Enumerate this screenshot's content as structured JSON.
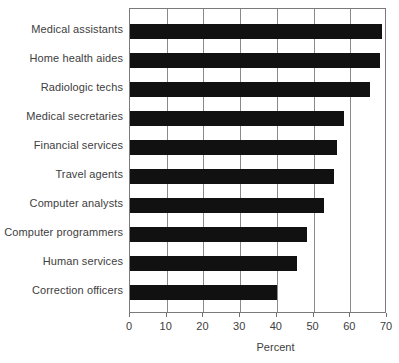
{
  "chart_data": {
    "type": "bar",
    "orientation": "horizontal",
    "title": "",
    "subtitle": "",
    "xlabel": "Percent",
    "ylabel": "",
    "xlim": [
      0,
      70
    ],
    "xticks": [
      0,
      10,
      20,
      30,
      40,
      50,
      60,
      70
    ],
    "grid": true,
    "grid_axis": "x",
    "legend": null,
    "bar_color": "#111111",
    "categories": [
      "Medical assistants",
      "Home health aides",
      "Radiologic techs",
      "Medical secretaries",
      "Financial services",
      "Travel agents",
      "Computer analysts",
      "Computer programmers",
      "Human services",
      "Correction officers"
    ],
    "values": [
      68.7,
      68.0,
      65.5,
      58.4,
      56.4,
      55.5,
      52.8,
      48.3,
      45.5,
      40.0
    ]
  }
}
